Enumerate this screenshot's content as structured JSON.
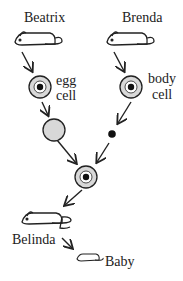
{
  "labels": {
    "donor_egg": "Beatrix",
    "donor_body": "Brenda",
    "egg_cell_1": "egg",
    "egg_cell_2": "cell",
    "body_cell_1": "body",
    "body_cell_2": "cell",
    "surrogate": "Belinda",
    "offspring": "Baby"
  },
  "colors": {
    "cell_fill": "#d8d8d8",
    "nucleus": "#111111",
    "stroke": "#222222"
  }
}
